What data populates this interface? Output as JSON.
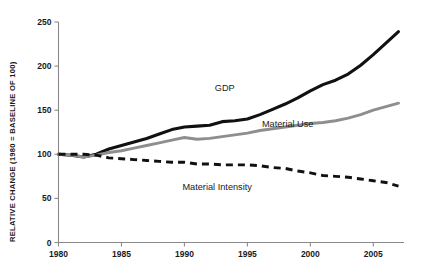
{
  "chart_data": {
    "type": "line",
    "title": "",
    "subtitle": "",
    "xlabel": "",
    "ylabel": "RELATIVE CHANGE (1980 = BASELINE OF 100)",
    "xlim": [
      1980,
      2007
    ],
    "ylim": [
      0,
      250
    ],
    "grid": false,
    "legend_position": "inline-annotations",
    "xticks": [
      1980,
      1985,
      1990,
      1995,
      2000,
      2005
    ],
    "xtick_labels": [
      "1980",
      "1985",
      "1990",
      "1995",
      "2000",
      "2005"
    ],
    "yticks": [
      0,
      50,
      100,
      150,
      200,
      250
    ],
    "ytick_labels": [
      "0",
      "50",
      "100",
      "150",
      "200",
      "250"
    ],
    "x": [
      1980,
      1981,
      1982,
      1983,
      1984,
      1985,
      1986,
      1987,
      1988,
      1989,
      1990,
      1991,
      1992,
      1993,
      1994,
      1995,
      1996,
      1997,
      1998,
      1999,
      2000,
      2001,
      2002,
      2003,
      2004,
      2005,
      2006,
      2007
    ],
    "series": [
      {
        "name": "GDP",
        "style": "solid",
        "color": "#111111",
        "label_x": 1993.2,
        "label_y": 172,
        "values": [
          100,
          99,
          97,
          100,
          106,
          110,
          114,
          118,
          123,
          128,
          131,
          132,
          133,
          137,
          138,
          140,
          145,
          151,
          157,
          164,
          172,
          179,
          184,
          191,
          201,
          213,
          226,
          239
        ]
      },
      {
        "name": "Material Use",
        "style": "solid",
        "color": "#8e8e8e",
        "label_x": 1998.2,
        "label_y": 131,
        "values": [
          100,
          99,
          97,
          99,
          102,
          104,
          107,
          110,
          113,
          116,
          119,
          117,
          118,
          120,
          122,
          124,
          127,
          129,
          131,
          133,
          135,
          136,
          138,
          141,
          145,
          150,
          154,
          158
        ]
      },
      {
        "name": "Material Intensity",
        "style": "dashed",
        "color": "#111111",
        "label_x": 1992.6,
        "label_y": 60,
        "values": [
          100,
          100,
          100,
          99,
          96,
          95,
          94,
          93,
          92,
          91,
          91,
          89,
          89,
          88,
          88,
          88,
          87,
          85,
          84,
          81,
          79,
          76,
          75,
          74,
          72,
          70,
          68,
          64
        ]
      }
    ]
  }
}
